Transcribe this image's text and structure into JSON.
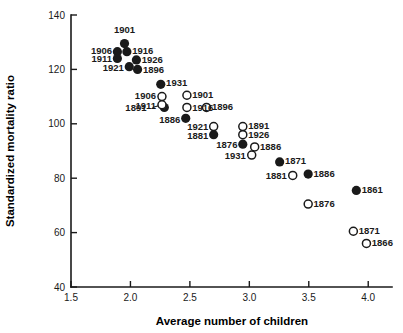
{
  "chart_data": {
    "type": "scatter",
    "title": "",
    "xlabel": "Average number of children",
    "ylabel": "Standardized mortality ratio",
    "xlim": [
      1.5,
      4.2
    ],
    "ylim": [
      40,
      140
    ],
    "grid": false,
    "legend": "none",
    "xticks": [
      "1.5",
      "2.0",
      "2.5",
      "3.0",
      "3.5",
      "4.0"
    ],
    "xtick_values": [
      1.5,
      2.0,
      2.5,
      3.0,
      3.5,
      4.0
    ],
    "yticks": [
      "140",
      "120",
      "100",
      "80",
      "60",
      "40"
    ],
    "ytick_values": [
      140,
      120,
      100,
      80,
      60,
      40
    ],
    "series": [
      {
        "name": "filled",
        "marker": "filled-circle",
        "color": "#1a1a1a",
        "points": [
          {
            "label": "1901",
            "x": 1.95,
            "y": 129.5,
            "lx": 1.95,
            "ly": 134.5,
            "anchor": "mid"
          },
          {
            "label": "1906",
            "x": 1.89,
            "y": 126.5,
            "lx": 1.845,
            "ly": 127.0,
            "anchor": "left"
          },
          {
            "label": "1916",
            "x": 1.97,
            "y": 126.5,
            "lx": 2.015,
            "ly": 127.0,
            "anchor": "right"
          },
          {
            "label": "1911",
            "x": 1.89,
            "y": 124.0,
            "lx": 1.845,
            "ly": 124.0,
            "anchor": "left"
          },
          {
            "label": "1926",
            "x": 2.05,
            "y": 123.5,
            "lx": 2.095,
            "ly": 123.6,
            "anchor": "right"
          },
          {
            "label": "1921",
            "x": 1.99,
            "y": 121.0,
            "lx": 1.945,
            "ly": 120.6,
            "anchor": "left"
          },
          {
            "label": "1896",
            "x": 2.06,
            "y": 120.0,
            "lx": 2.105,
            "ly": 120.0,
            "anchor": "right"
          },
          {
            "label": "1931",
            "x": 2.255,
            "y": 114.5,
            "lx": 2.3,
            "ly": 115.0,
            "anchor": "right"
          },
          {
            "label": "1891",
            "x": 2.285,
            "y": 106.0,
            "lx": 2.135,
            "ly": 106.0,
            "anchor": "left"
          },
          {
            "label": "1886",
            "x": 2.465,
            "y": 102.0,
            "lx": 2.42,
            "ly": 101.5,
            "anchor": "left"
          },
          {
            "label": "1881",
            "x": 2.7,
            "y": 96.0,
            "lx": 2.655,
            "ly": 95.6,
            "anchor": "left"
          },
          {
            "label": "1876",
            "x": 2.945,
            "y": 92.5,
            "lx": 2.9,
            "ly": 92.2,
            "anchor": "left"
          },
          {
            "label": "1871",
            "x": 3.255,
            "y": 86.0,
            "lx": 3.3,
            "ly": 86.4,
            "anchor": "right"
          },
          {
            "label": "1886",
            "x": 3.495,
            "y": 81.5,
            "lx": 3.54,
            "ly": 81.8,
            "anchor": "right"
          },
          {
            "label": "1861",
            "x": 3.9,
            "y": 75.5,
            "lx": 3.945,
            "ly": 75.8,
            "anchor": "right"
          }
        ]
      },
      {
        "name": "open",
        "marker": "open-circle",
        "color": "#1a1a1a",
        "points": [
          {
            "label": "1906",
            "x": 2.265,
            "y": 110.0,
            "lx": 2.215,
            "ly": 110.2,
            "anchor": "left"
          },
          {
            "label": "1901",
            "x": 2.475,
            "y": 110.5,
            "lx": 2.52,
            "ly": 110.7,
            "anchor": "right"
          },
          {
            "label": "1911",
            "x": 2.265,
            "y": 107.0,
            "lx": 2.215,
            "ly": 106.8,
            "anchor": "left"
          },
          {
            "label": "1916",
            "x": 2.475,
            "y": 106.0,
            "lx": 2.52,
            "ly": 106.0,
            "anchor": "right"
          },
          {
            "label": "1896",
            "x": 2.64,
            "y": 106.0,
            "lx": 2.685,
            "ly": 106.2,
            "anchor": "right"
          },
          {
            "label": "1891",
            "x": 2.945,
            "y": 99.0,
            "lx": 2.99,
            "ly": 99.4,
            "anchor": "right"
          },
          {
            "label": "1921",
            "x": 2.7,
            "y": 99.0,
            "lx": 2.655,
            "ly": 98.8,
            "anchor": "left"
          },
          {
            "label": "1926",
            "x": 2.945,
            "y": 96.0,
            "lx": 2.99,
            "ly": 96.2,
            "anchor": "right"
          },
          {
            "label": "1886",
            "x": 3.045,
            "y": 91.5,
            "lx": 3.09,
            "ly": 91.8,
            "anchor": "right"
          },
          {
            "label": "1931",
            "x": 3.02,
            "y": 88.5,
            "lx": 2.97,
            "ly": 88.2,
            "anchor": "left"
          },
          {
            "label": "1881",
            "x": 3.365,
            "y": 81.0,
            "lx": 3.315,
            "ly": 80.8,
            "anchor": "left"
          },
          {
            "label": "1876",
            "x": 3.495,
            "y": 70.5,
            "lx": 3.54,
            "ly": 70.6,
            "anchor": "right"
          },
          {
            "label": "1871",
            "x": 3.875,
            "y": 60.5,
            "lx": 3.92,
            "ly": 60.7,
            "anchor": "right"
          },
          {
            "label": "1866",
            "x": 3.985,
            "y": 56.0,
            "lx": 4.03,
            "ly": 56.2,
            "anchor": "right"
          }
        ]
      }
    ],
    "leader_lines": [
      {
        "from_x": 2.185,
        "from_y": 106.0,
        "to_x": 2.265,
        "to_y": 107.0
      }
    ]
  }
}
